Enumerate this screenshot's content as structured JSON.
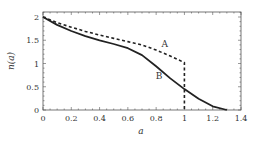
{
  "chart_data": {
    "type": "line",
    "title": "",
    "xlabel": "a",
    "ylabel": "n(a)",
    "xlim": [
      0,
      1.4
    ],
    "ylim": [
      0,
      2.1
    ],
    "xticks": [
      "0",
      "0.2",
      "0.4",
      "0.6",
      "0.8",
      "1",
      "1.2",
      "1.4"
    ],
    "yticks": [
      "0",
      "0.5",
      "1",
      "1.5",
      "2"
    ],
    "grid": false,
    "legend": "none",
    "series": [
      {
        "name": "A",
        "style": "dashed",
        "x": [
          0,
          0.1,
          0.2,
          0.3,
          0.4,
          0.5,
          0.6,
          0.7,
          0.8,
          0.9,
          1.0,
          1.0
        ],
        "y": [
          2.0,
          1.88,
          1.78,
          1.69,
          1.61,
          1.54,
          1.47,
          1.4,
          1.29,
          1.16,
          1.02,
          0.0
        ]
      },
      {
        "name": "B",
        "style": "solid",
        "x": [
          0,
          0.1,
          0.2,
          0.3,
          0.4,
          0.5,
          0.6,
          0.7,
          0.8,
          0.9,
          1.0,
          1.1,
          1.2,
          1.3
        ],
        "y": [
          2.0,
          1.83,
          1.7,
          1.59,
          1.5,
          1.42,
          1.33,
          1.18,
          0.94,
          0.68,
          0.45,
          0.24,
          0.08,
          0.0
        ]
      }
    ],
    "annotations": [
      {
        "text": "A",
        "x": 0.86,
        "y": 1.36
      },
      {
        "text": "B",
        "x": 0.82,
        "y": 0.67
      }
    ]
  }
}
